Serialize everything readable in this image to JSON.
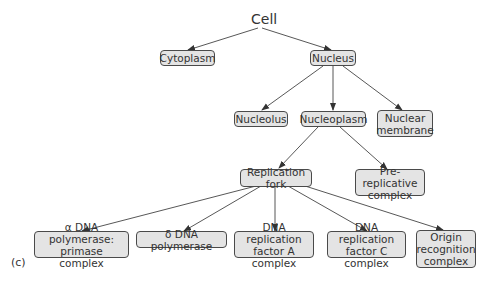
{
  "diagram": {
    "root": "Cell",
    "panel_label": "(c)",
    "nodes": {
      "cytoplasm": "Cytoplasm",
      "nucleus": "Nucleus",
      "nucleolus": "Nucleolus",
      "nucleoplasm": "Nucleoplasm",
      "nuclear_membrane": "Nuclear membrane",
      "replication_fork": "Replication fork",
      "pre_replicative_complex": "Pre-replicative complex",
      "alpha_dna_polymerase": "α DNA polymerase: primase complex",
      "delta_dna_polymerase": "δ DNA polymerase",
      "replication_factor_a": "DNA replication factor A complex",
      "replication_factor_c": "DNA replication factor C complex",
      "origin_recognition_complex": "Origin recognition complex"
    },
    "edges": [
      [
        "Cell",
        "Cytoplasm"
      ],
      [
        "Cell",
        "Nucleus"
      ],
      [
        "Nucleus",
        "Nucleolus"
      ],
      [
        "Nucleus",
        "Nucleoplasm"
      ],
      [
        "Nucleus",
        "Nuclear membrane"
      ],
      [
        "Nucleoplasm",
        "Replication fork"
      ],
      [
        "Nucleoplasm",
        "Pre-replicative complex"
      ],
      [
        "Replication fork",
        "α DNA polymerase: primase complex"
      ],
      [
        "Replication fork",
        "δ DNA polymerase"
      ],
      [
        "Replication fork",
        "DNA replication factor A complex"
      ],
      [
        "Replication fork",
        "DNA replication factor C complex"
      ],
      [
        "Replication fork",
        "Origin recognition complex"
      ]
    ]
  }
}
